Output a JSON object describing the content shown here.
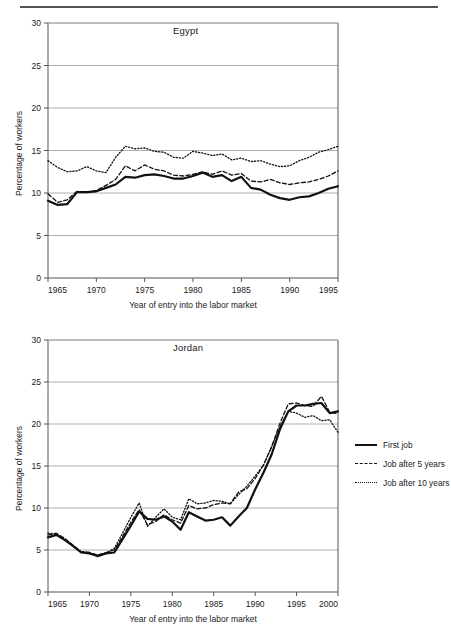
{
  "page": {
    "background": "#ffffff",
    "ink": "#1a1a1a",
    "grid_color": "#9a9a9a",
    "axis_color": "#555555",
    "top_rule": true
  },
  "legend": {
    "position": "right-middle",
    "items": [
      {
        "label": "First job",
        "style": "solid",
        "icon": "solid-line-icon"
      },
      {
        "label": "Job after 5 years",
        "style": "dashed",
        "icon": "dashed-line-icon"
      },
      {
        "label": "Job after 10 years",
        "style": "dotted",
        "icon": "dotted-line-icon"
      }
    ]
  },
  "chart_data": [
    {
      "id": "egypt",
      "type": "line",
      "title": "Egypt",
      "xlabel": "Year of entry into the labor market",
      "ylabel": "Percentage of workers",
      "xlim": [
        1965,
        1995
      ],
      "ylim": [
        0,
        30
      ],
      "xticks": [
        1965,
        1970,
        1975,
        1980,
        1985,
        1990,
        1995
      ],
      "yticks": [
        0,
        5,
        10,
        15,
        20,
        25,
        30
      ],
      "grid": "horizontal",
      "legend": "none",
      "x": [
        1965,
        1966,
        1967,
        1968,
        1969,
        1970,
        1971,
        1972,
        1973,
        1974,
        1975,
        1976,
        1977,
        1978,
        1979,
        1980,
        1981,
        1982,
        1983,
        1984,
        1985,
        1986,
        1987,
        1988,
        1989,
        1990,
        1991,
        1992,
        1993,
        1994,
        1995
      ],
      "series": [
        {
          "name": "First job",
          "style": "solid",
          "values": [
            9.1,
            8.6,
            8.7,
            10.1,
            10.1,
            10.2,
            10.6,
            11.0,
            11.9,
            11.8,
            12.1,
            12.2,
            12.0,
            11.7,
            11.7,
            12.0,
            12.4,
            11.9,
            12.1,
            11.4,
            11.9,
            10.6,
            10.4,
            9.8,
            9.4,
            9.2,
            9.5,
            9.6,
            10.0,
            10.5,
            10.8
          ]
        },
        {
          "name": "Job after 5 years",
          "style": "dashed",
          "values": [
            9.9,
            8.9,
            9.2,
            10.2,
            10.1,
            10.3,
            10.9,
            11.6,
            13.2,
            12.6,
            13.3,
            12.8,
            12.6,
            12.1,
            12.0,
            12.2,
            12.5,
            12.2,
            12.6,
            12.1,
            12.3,
            11.4,
            11.3,
            11.6,
            11.2,
            11.0,
            11.2,
            11.3,
            11.6,
            12.0,
            12.6
          ]
        },
        {
          "name": "Job after 10 years",
          "style": "dotted",
          "values": [
            13.8,
            13.0,
            12.5,
            12.6,
            13.1,
            12.6,
            12.4,
            14.2,
            15.5,
            15.2,
            15.3,
            14.9,
            14.8,
            14.2,
            14.1,
            14.9,
            14.7,
            14.4,
            14.6,
            13.9,
            14.1,
            13.7,
            13.8,
            13.4,
            13.1,
            13.2,
            13.8,
            14.2,
            14.8,
            15.1,
            15.5
          ]
        }
      ]
    },
    {
      "id": "jordan",
      "type": "line",
      "title": "Jordan",
      "xlabel": "Year of entry into the labor market",
      "ylabel": "Percentage of workers",
      "xlim": [
        1965,
        2000
      ],
      "ylim": [
        0,
        30
      ],
      "xticks": [
        1965,
        1970,
        1975,
        1980,
        1985,
        1990,
        1995,
        2000
      ],
      "yticks": [
        0,
        5,
        10,
        15,
        20,
        25,
        30
      ],
      "grid": "horizontal",
      "legend": "right",
      "x": [
        1965,
        1966,
        1967,
        1968,
        1969,
        1970,
        1971,
        1972,
        1973,
        1974,
        1975,
        1976,
        1977,
        1978,
        1979,
        1980,
        1981,
        1982,
        1983,
        1984,
        1985,
        1986,
        1987,
        1988,
        1989,
        1990,
        1991,
        1992,
        1993,
        1994,
        1995,
        1996,
        1997,
        1998,
        1999,
        2000
      ],
      "series": [
        {
          "name": "First job",
          "style": "solid",
          "values": [
            6.5,
            6.8,
            6.2,
            5.5,
            4.7,
            4.6,
            4.3,
            4.6,
            4.7,
            6.3,
            7.9,
            9.6,
            8.7,
            8.6,
            9.0,
            8.4,
            7.4,
            9.5,
            9.0,
            8.5,
            8.6,
            8.9,
            7.9,
            9.0,
            10.0,
            12.2,
            14.2,
            16.4,
            19.4,
            21.5,
            22.2,
            22.2,
            22.4,
            22.5,
            21.3,
            21.5
          ]
        },
        {
          "name": "Job after 5 years",
          "style": "dashed",
          "values": [
            6.8,
            7.0,
            6.4,
            5.6,
            4.8,
            4.7,
            4.4,
            4.7,
            5.0,
            6.6,
            8.3,
            9.8,
            8.0,
            8.4,
            9.2,
            8.6,
            8.2,
            10.3,
            9.9,
            10.0,
            10.4,
            10.6,
            10.5,
            11.9,
            12.3,
            13.5,
            15.1,
            17.3,
            20.1,
            22.4,
            22.5,
            22.2,
            22.1,
            23.3,
            21.4,
            21.2
          ]
        },
        {
          "name": "Job after 10 years",
          "style": "dotted",
          "values": [
            7.0,
            6.9,
            6.3,
            5.5,
            4.8,
            4.7,
            4.2,
            4.6,
            5.2,
            7.0,
            8.9,
            10.6,
            7.8,
            8.9,
            9.9,
            8.9,
            8.6,
            11.1,
            10.5,
            10.6,
            10.9,
            10.8,
            10.5,
            11.6,
            12.6,
            13.8,
            15.1,
            17.3,
            19.7,
            21.5,
            21.3,
            20.8,
            21.0,
            20.4,
            20.5,
            19.0
          ]
        }
      ]
    }
  ]
}
